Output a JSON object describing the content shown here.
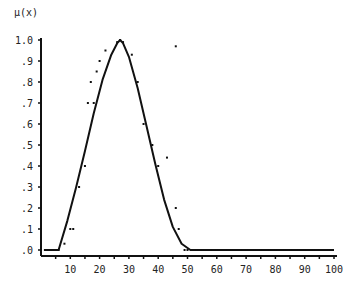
{
  "chart_data": {
    "type": "line",
    "title": "",
    "xlabel": "",
    "ylabel": "μ(x)",
    "xlim": [
      0,
      100
    ],
    "ylim": [
      0,
      1.0
    ],
    "grid": false,
    "legend": null,
    "x_ticks": [
      10,
      20,
      30,
      40,
      50,
      60,
      70,
      80,
      90,
      100
    ],
    "x_tick_labels": [
      "10",
      "20",
      "30",
      "40",
      "50",
      "60",
      "70",
      "80",
      "90",
      "100"
    ],
    "y_ticks": [
      0,
      0.1,
      0.2,
      0.3,
      0.4,
      0.5,
      0.6,
      0.7,
      0.8,
      0.9,
      1.0
    ],
    "y_tick_labels": [
      ".0",
      ".1",
      ".2",
      ".3",
      ".4",
      ".5",
      ".6",
      ".7",
      ".8",
      ".9",
      "1.0"
    ],
    "series": [
      {
        "name": "fitted membership function",
        "kind": "line",
        "color": "#111111",
        "x": [
          1,
          3,
          6,
          9,
          12,
          15,
          18,
          21,
          24,
          26,
          27,
          28,
          30,
          33,
          36,
          39,
          42,
          45,
          48,
          51,
          60,
          70,
          80,
          90,
          100
        ],
        "y": [
          0.0,
          0.0,
          0.0,
          0.14,
          0.3,
          0.47,
          0.65,
          0.81,
          0.93,
          0.985,
          1.0,
          0.985,
          0.92,
          0.77,
          0.59,
          0.41,
          0.24,
          0.11,
          0.03,
          0.0,
          0.0,
          0.0,
          0.0,
          0.0,
          0.0
        ]
      },
      {
        "name": "observed points",
        "kind": "scatter",
        "color": "#111111",
        "x": [
          2,
          4,
          6,
          8,
          10,
          11,
          13,
          15,
          16,
          17,
          18,
          19,
          20,
          22,
          26,
          27,
          28,
          31,
          33,
          35,
          38,
          40,
          43,
          46,
          46,
          47,
          49,
          50,
          53,
          55,
          58,
          60,
          63,
          65,
          68,
          70,
          73,
          75,
          78,
          80,
          83,
          85,
          88,
          90,
          93,
          95,
          98
        ],
        "y": [
          0.0,
          0.0,
          0.0,
          0.03,
          0.1,
          0.1,
          0.3,
          0.4,
          0.7,
          0.8,
          0.7,
          0.85,
          0.9,
          0.95,
          0.99,
          1.0,
          0.99,
          0.93,
          0.8,
          0.6,
          0.5,
          0.4,
          0.44,
          0.2,
          0.97,
          0.1,
          0.0,
          0.0,
          0.0,
          0.0,
          0.0,
          0.0,
          0.0,
          0.0,
          0.0,
          0.0,
          0.0,
          0.0,
          0.0,
          0.0,
          0.0,
          0.0,
          0.0,
          0.0,
          0.0,
          0.0,
          0.0
        ]
      }
    ]
  },
  "layout": {
    "plot_left": 41,
    "plot_right": 334,
    "plot_top": 40,
    "plot_bottom": 250,
    "axis_line_y": 256
  }
}
